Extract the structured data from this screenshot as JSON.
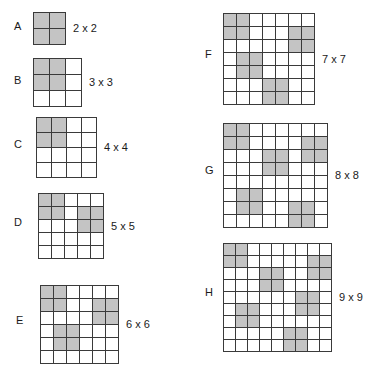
{
  "figure": {
    "title": "",
    "background_color": "#ffffff",
    "cell_fill_color": "#c4c4c4",
    "cell_empty_color": "#ffffff",
    "grid_line_color": "#3a3a3a",
    "text_color": "#1a1a1a"
  },
  "panels": [
    {
      "letter": "A",
      "size_label": "2 x 2",
      "n": 2,
      "cell_px": 15,
      "left": 33,
      "top": 12,
      "letter_x": 14,
      "cells": [
        [
          1,
          1
        ],
        [
          1,
          1
        ]
      ]
    },
    {
      "letter": "B",
      "size_label": "3 x 3",
      "n": 3,
      "cell_px": 15,
      "left": 33,
      "top": 58,
      "letter_x": 14,
      "cells": [
        [
          1,
          1,
          0
        ],
        [
          1,
          1,
          0
        ],
        [
          0,
          0,
          0
        ]
      ]
    },
    {
      "letter": "C",
      "size_label": "4 x 4",
      "n": 4,
      "cell_px": 14,
      "left": 36,
      "top": 117,
      "letter_x": 14,
      "cells": [
        [
          1,
          1,
          0,
          0
        ],
        [
          1,
          1,
          0,
          0
        ],
        [
          0,
          0,
          0,
          0
        ],
        [
          0,
          0,
          0,
          0
        ]
      ]
    },
    {
      "letter": "D",
      "size_label": "5 x 5",
      "n": 5,
      "cell_px": 12,
      "left": 38,
      "top": 193,
      "letter_x": 14,
      "cells": [
        [
          1,
          1,
          0,
          0,
          0
        ],
        [
          1,
          1,
          0,
          1,
          1
        ],
        [
          0,
          0,
          0,
          1,
          1
        ],
        [
          0,
          0,
          0,
          0,
          0
        ],
        [
          0,
          0,
          0,
          0,
          0
        ]
      ]
    },
    {
      "letter": "E",
      "size_label": "6 x 6",
      "n": 6,
      "cell_px": 12,
      "left": 40,
      "top": 285,
      "letter_x": 16,
      "cells": [
        [
          1,
          1,
          0,
          0,
          0,
          0
        ],
        [
          1,
          1,
          0,
          0,
          1,
          1
        ],
        [
          0,
          0,
          0,
          0,
          1,
          1
        ],
        [
          0,
          1,
          1,
          0,
          0,
          0
        ],
        [
          0,
          1,
          1,
          0,
          0,
          0
        ],
        [
          0,
          0,
          0,
          0,
          0,
          0
        ]
      ]
    },
    {
      "letter": "F",
      "size_label": "7 x 7",
      "n": 7,
      "cell_px": 12,
      "left": 223,
      "top": 13,
      "letter_x": 205,
      "cells": [
        [
          1,
          1,
          0,
          0,
          0,
          0,
          0
        ],
        [
          1,
          1,
          0,
          0,
          0,
          1,
          1
        ],
        [
          0,
          0,
          0,
          0,
          0,
          1,
          1
        ],
        [
          0,
          1,
          1,
          0,
          0,
          0,
          0
        ],
        [
          0,
          1,
          1,
          0,
          0,
          0,
          0
        ],
        [
          0,
          0,
          0,
          1,
          1,
          0,
          0
        ],
        [
          0,
          0,
          0,
          1,
          1,
          0,
          0
        ]
      ]
    },
    {
      "letter": "G",
      "size_label": "8 x 8",
      "n": 8,
      "cell_px": 12,
      "left": 223,
      "top": 123,
      "letter_x": 205,
      "cells": [
        [
          1,
          1,
          0,
          0,
          0,
          0,
          0,
          0
        ],
        [
          1,
          1,
          0,
          0,
          0,
          0,
          1,
          1
        ],
        [
          0,
          0,
          0,
          1,
          1,
          0,
          1,
          1
        ],
        [
          0,
          0,
          0,
          1,
          1,
          0,
          0,
          0
        ],
        [
          0,
          0,
          0,
          0,
          0,
          0,
          0,
          0
        ],
        [
          0,
          1,
          1,
          0,
          0,
          0,
          0,
          0
        ],
        [
          0,
          1,
          1,
          0,
          0,
          1,
          1,
          0
        ],
        [
          0,
          0,
          0,
          0,
          0,
          1,
          1,
          0
        ]
      ]
    },
    {
      "letter": "H",
      "size_label": "9 x 9",
      "n": 9,
      "cell_px": 11,
      "left": 223,
      "top": 243,
      "letter_x": 205,
      "cells": [
        [
          1,
          1,
          0,
          0,
          0,
          0,
          0,
          0,
          0
        ],
        [
          1,
          1,
          0,
          0,
          0,
          0,
          0,
          1,
          1
        ],
        [
          0,
          0,
          0,
          1,
          1,
          0,
          0,
          1,
          1
        ],
        [
          0,
          0,
          0,
          1,
          1,
          0,
          0,
          0,
          0
        ],
        [
          0,
          0,
          0,
          0,
          0,
          0,
          1,
          1,
          0
        ],
        [
          0,
          1,
          1,
          0,
          0,
          0,
          1,
          1,
          0
        ],
        [
          0,
          1,
          1,
          0,
          0,
          0,
          0,
          0,
          0
        ],
        [
          0,
          0,
          0,
          0,
          0,
          1,
          1,
          0,
          0
        ],
        [
          0,
          0,
          0,
          0,
          0,
          1,
          1,
          0,
          0
        ]
      ]
    }
  ]
}
